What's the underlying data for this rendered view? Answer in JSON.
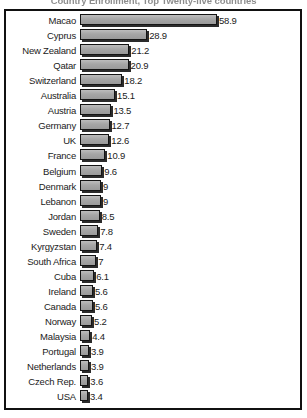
{
  "chart_data": {
    "type": "bar",
    "orientation": "horizontal",
    "title": "Country Enrollment, Top Twenty-five countries",
    "xlabel": "",
    "ylabel": "",
    "grid": false,
    "legend": "none",
    "xlim": [
      0,
      58.9
    ],
    "categories": [
      "Macao",
      "Cyprus",
      "New Zealand",
      "Qatar",
      "Switzerland",
      "Australia",
      "Austria",
      "Germany",
      "UK",
      "France",
      "Belgium",
      "Denmark",
      "Lebanon",
      "Jordan",
      "Sweden",
      "Kyrgyzstan",
      "South Africa",
      "Cuba",
      "Ireland",
      "Canada",
      "Norway",
      "Malaysia",
      "Portugal",
      "Netherlands",
      "Czech Rep.",
      "USA"
    ],
    "values": [
      58.9,
      28.9,
      21.2,
      20.9,
      18.2,
      15.1,
      13.5,
      12.7,
      12.6,
      10.9,
      9.6,
      9,
      9,
      8.5,
      7.8,
      7.4,
      7,
      6.1,
      5.6,
      5.6,
      5.2,
      4.4,
      3.9,
      3.9,
      3.6,
      3.4
    ],
    "value_labels": [
      "58.9",
      "28.9",
      "21.2",
      "20.9",
      "18.2",
      "15.1",
      "13.5",
      "12.7",
      "12.6",
      "10.9",
      "9.6",
      "9",
      "9",
      "8.5",
      "7.8",
      "7.4",
      "7",
      "6.1",
      "5.6",
      "5.6",
      "5.2",
      "4.4",
      "3.9",
      "3.9",
      "3.6",
      "3.4"
    ],
    "colors": {
      "bar_fill": "#a8a8a8",
      "bar_border": "#141414",
      "bar_shadow": "#2b2b2b",
      "frame": "#111111",
      "text": "#1b1b1b",
      "background": "#ffffff"
    }
  }
}
